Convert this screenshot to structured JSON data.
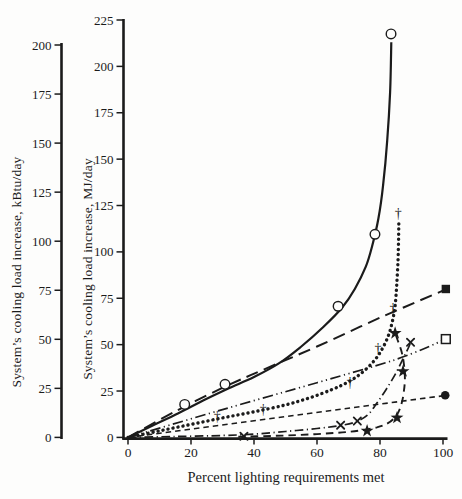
{
  "figure": {
    "bg": "#fdfdfc",
    "ink": "#1b1b1b"
  },
  "chart_data": {
    "type": "line",
    "title": "",
    "x_axis": {
      "label": "Percent lighting requirements met",
      "min": 0,
      "max": 100,
      "ticks": [
        0,
        20,
        40,
        60,
        80,
        100
      ]
    },
    "y_axis_inner": {
      "label": "System’s cooling load increase, MJ/day",
      "min": 0,
      "max": 225,
      "ticks": [
        0,
        25,
        50,
        75,
        100,
        125,
        150,
        175,
        200,
        225
      ]
    },
    "y_axis_outer": {
      "label": "System’s cooling load increase, kBtu/day",
      "min": 0,
      "max": 200,
      "ticks": [
        0,
        25,
        50,
        75,
        100,
        125,
        150,
        175,
        200
      ]
    },
    "series": [
      {
        "id": "open-circle-solid",
        "line": "solid",
        "marker": "open-circle",
        "smooth": true,
        "curve": [
          [
            0,
            0
          ],
          [
            8,
            6.5
          ],
          [
            16,
            13
          ],
          [
            24,
            20
          ],
          [
            32,
            26.5
          ],
          [
            40,
            32.5
          ],
          [
            48,
            40
          ],
          [
            55,
            49
          ],
          [
            62,
            59.5
          ],
          [
            68,
            70
          ],
          [
            72,
            80
          ],
          [
            75.5,
            92
          ],
          [
            77.5,
            103
          ],
          [
            79.5,
            118
          ],
          [
            81,
            136
          ],
          [
            82.3,
            160
          ],
          [
            83.2,
            186
          ],
          [
            83.6,
            213
          ]
        ],
        "markers": [
          [
            18,
            17.8
          ],
          [
            30.8,
            28.6
          ],
          [
            66.7,
            70.7
          ],
          [
            78.4,
            109.5
          ],
          [
            83.5,
            217.5
          ]
        ]
      },
      {
        "id": "dagger-dotted",
        "line": "dotted",
        "marker": "dagger",
        "smooth": true,
        "curve": [
          [
            0,
            0
          ],
          [
            10,
            3.5
          ],
          [
            20,
            7
          ],
          [
            30,
            10.5
          ],
          [
            40,
            13.8
          ],
          [
            50,
            17.5
          ],
          [
            58,
            21.5
          ],
          [
            65,
            26
          ],
          [
            70,
            30
          ],
          [
            74,
            34.5
          ],
          [
            78,
            41
          ],
          [
            80.8,
            48
          ],
          [
            82.8,
            55.5
          ],
          [
            84,
            63
          ],
          [
            84.8,
            71
          ],
          [
            85.3,
            82
          ],
          [
            85.7,
            95
          ],
          [
            85.9,
            107
          ],
          [
            86,
            117
          ]
        ],
        "markers": [
          [
            28.3,
            11
          ],
          [
            42.9,
            14.8
          ],
          [
            70.5,
            29.7
          ],
          [
            79.4,
            48
          ],
          [
            84.1,
            69.6
          ],
          [
            85.8,
            120.5
          ]
        ]
      },
      {
        "id": "filled-square-long-dash",
        "line": "long-dash",
        "marker": "filled-square",
        "smooth": true,
        "curve": [
          [
            0,
            0
          ],
          [
            15,
            14
          ],
          [
            31,
            27.5
          ],
          [
            45,
            38
          ],
          [
            60,
            49
          ],
          [
            80,
            64.5
          ],
          [
            100.5,
            79.5
          ]
        ],
        "markers": [
          [
            100.9,
            80
          ]
        ]
      },
      {
        "id": "open-square-dash-dot-dot",
        "line": "dash-dot-dot",
        "marker": "open-square",
        "smooth": true,
        "curve": [
          [
            0,
            0
          ],
          [
            30,
            15
          ],
          [
            60,
            29.5
          ],
          [
            85,
            42
          ],
          [
            100.3,
            52.5
          ]
        ],
        "markers": [
          [
            100.9,
            53
          ]
        ]
      },
      {
        "id": "filled-circle-short-dash",
        "line": "short-dash",
        "marker": "filled-circle",
        "smooth": false,
        "curve": [
          [
            0,
            0
          ],
          [
            50,
            11.2
          ],
          [
            100.2,
            22.5
          ]
        ],
        "markers": [
          [
            100.7,
            22.7
          ]
        ]
      },
      {
        "id": "star-medium-dash",
        "line": "medium-dash",
        "marker": "filled-star",
        "smooth": true,
        "curve": [
          [
            35,
            0.3
          ],
          [
            50,
            1
          ],
          [
            60,
            1.8
          ],
          [
            68,
            2.7
          ],
          [
            74,
            3.8
          ],
          [
            79,
            5.4
          ],
          [
            82,
            7.2
          ],
          [
            84.2,
            9.8
          ],
          [
            85.8,
            13.5
          ],
          [
            86.9,
            18.5
          ],
          [
            87.6,
            25
          ],
          [
            87.9,
            32
          ],
          [
            87.6,
            39.5
          ],
          [
            86.8,
            46.5
          ],
          [
            85.6,
            52.5
          ],
          [
            84.8,
            56.5
          ]
        ],
        "markers": [
          [
            75.9,
            3.5
          ],
          [
            85.4,
            10.6
          ],
          [
            87.3,
            35.6
          ],
          [
            84.8,
            56.2
          ]
        ]
      },
      {
        "id": "x-dash-dot",
        "line": "dash-dot",
        "marker": "x-cross",
        "smooth": true,
        "curve": [
          [
            0,
            0
          ],
          [
            15,
            0.5
          ],
          [
            30,
            1
          ],
          [
            40,
            1.8
          ],
          [
            50,
            3.2
          ],
          [
            60,
            4.8
          ],
          [
            67,
            6.3
          ],
          [
            72,
            8.2
          ],
          [
            76,
            12
          ],
          [
            79,
            18.5
          ],
          [
            82,
            26
          ],
          [
            85,
            34.5
          ],
          [
            87.5,
            43
          ],
          [
            89.2,
            49
          ],
          [
            89.8,
            52
          ]
        ],
        "markers": [
          [
            36.8,
            0.6
          ],
          [
            67.5,
            6.6
          ],
          [
            72.8,
            8.8
          ],
          [
            89.7,
            51.3
          ]
        ]
      }
    ]
  }
}
